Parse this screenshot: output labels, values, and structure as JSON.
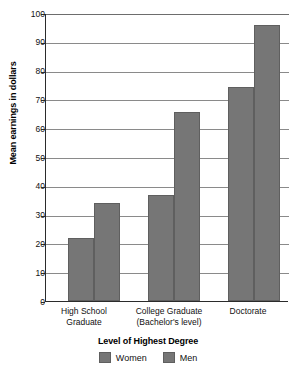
{
  "chart_data": {
    "type": "bar",
    "title": "",
    "categories": [
      "High School Graduate",
      "College Graduate (Bachelor's level)",
      "Doctorate"
    ],
    "category_lines": [
      [
        "High School",
        "Graduate"
      ],
      [
        "College Graduate",
        "(Bachelor's level)"
      ],
      [
        "Doctorate",
        ""
      ]
    ],
    "series": [
      {
        "name": "Women",
        "values": [
          22,
          37,
          74.5
        ],
        "color": "#767676"
      },
      {
        "name": "Men",
        "values": [
          34,
          66,
          96
        ],
        "color": "#767676"
      }
    ],
    "xlabel": "Level of Highest Degree",
    "ylabel": "Mean earnings in dollars",
    "ylim": [
      0,
      100
    ],
    "yticks": [
      0,
      10,
      20,
      30,
      40,
      50,
      60,
      70,
      80,
      90,
      100
    ],
    "ytick_labels": [
      "0",
      "10",
      "20",
      "30",
      "40",
      "50",
      "60",
      "70",
      "80",
      "90",
      "100"
    ],
    "grid": true,
    "grid_axis": "y",
    "legend_position": "bottom",
    "legend_entries": [
      "Women",
      "Men"
    ],
    "axis_color": "#2b2b2b",
    "grid_color": "#8a8a8a",
    "background_color": "#ffffff"
  }
}
